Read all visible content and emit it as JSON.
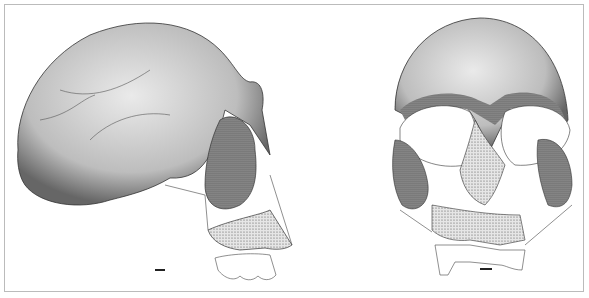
{
  "figure": {
    "views": [
      {
        "name": "lateral-view",
        "label": ""
      },
      {
        "name": "frontal-view",
        "label": ""
      }
    ],
    "scale_bars": 2
  }
}
